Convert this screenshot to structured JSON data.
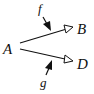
{
  "diagram": {
    "nodes": {
      "source": "A",
      "target_top": "B",
      "target_bottom": "D"
    },
    "labels": {
      "top_arrow": "f",
      "bottom_arrow": "g"
    },
    "edges": [
      {
        "from": "A",
        "to": "B",
        "label": "f",
        "head": "open-triangle"
      },
      {
        "from": "A",
        "to": "D",
        "label": "g",
        "head": "open-triangle"
      }
    ],
    "colors": {
      "ink": "#111111",
      "background": "#ffffff"
    }
  }
}
